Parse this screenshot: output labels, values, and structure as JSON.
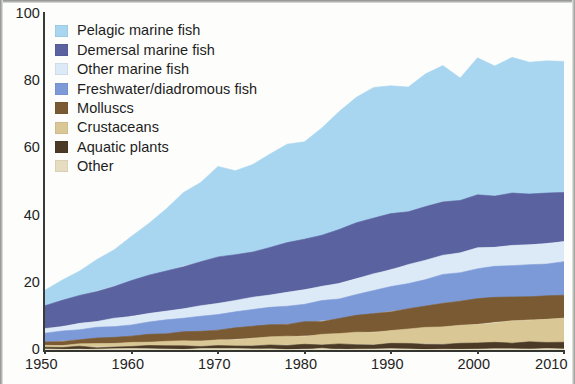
{
  "chart_data": {
    "type": "area",
    "stacked": true,
    "title": "",
    "subtitle": "",
    "xlabel": "",
    "ylabel": "",
    "xlim": [
      1950,
      2010
    ],
    "ylim": [
      0,
      100
    ],
    "xticks": [
      1950,
      1960,
      1970,
      1980,
      1990,
      2000,
      2010
    ],
    "yticks": [
      0,
      20,
      40,
      60,
      80,
      100
    ],
    "grid": false,
    "legend_position": "top-left",
    "x": [
      1950,
      1952,
      1954,
      1956,
      1958,
      1960,
      1962,
      1964,
      1966,
      1968,
      1970,
      1972,
      1974,
      1976,
      1978,
      1980,
      1982,
      1984,
      1986,
      1988,
      1990,
      1992,
      1994,
      1996,
      1998,
      2000,
      2002,
      2004,
      2006,
      2008,
      2010
    ],
    "series": [
      {
        "name": "Pelagic marine fish",
        "color": "#a8d6f0",
        "values": [
          4.6,
          6.2,
          7.4,
          9.2,
          10.8,
          13.4,
          15.6,
          18.4,
          21.6,
          23.8,
          26.8,
          25.4,
          26.0,
          27.8,
          29.6,
          29.0,
          31.8,
          35.2,
          37.4,
          38.6,
          38.0,
          37.2,
          39.4,
          40.2,
          36.6,
          40.6,
          38.6,
          40.4,
          39.2,
          39.6,
          39.0
        ]
      },
      {
        "name": "Demersal marine fish",
        "color": "#5a62a0",
        "values": [
          6.8,
          7.6,
          8.2,
          9.0,
          9.6,
          10.4,
          11.2,
          11.8,
          12.6,
          13.2,
          13.8,
          13.6,
          13.8,
          14.2,
          14.6,
          14.8,
          15.2,
          15.8,
          16.4,
          16.8,
          16.4,
          15.8,
          16.0,
          16.2,
          15.4,
          15.8,
          15.2,
          15.4,
          15.0,
          14.8,
          14.6
        ]
      },
      {
        "name": "Other marine fish",
        "color": "#dce9f6",
        "values": [
          1.4,
          1.6,
          1.8,
          2.0,
          2.2,
          2.4,
          2.6,
          2.8,
          3.0,
          3.2,
          3.4,
          3.4,
          3.6,
          3.8,
          4.0,
          4.2,
          4.4,
          4.6,
          4.8,
          5.0,
          5.2,
          5.4,
          5.6,
          5.8,
          5.8,
          6.0,
          6.0,
          6.0,
          6.0,
          6.0,
          6.0
        ]
      },
      {
        "name": "Freshwater/diadromous fish",
        "color": "#7d9ad8",
        "values": [
          2.6,
          2.8,
          3.0,
          3.2,
          3.4,
          3.6,
          3.8,
          4.0,
          4.2,
          4.4,
          4.6,
          4.8,
          5.0,
          5.2,
          5.4,
          5.6,
          5.8,
          6.0,
          6.4,
          6.8,
          7.2,
          7.6,
          8.0,
          8.4,
          8.6,
          9.0,
          9.2,
          9.4,
          9.6,
          9.8,
          10.0
        ]
      },
      {
        "name": "Molluscs",
        "color": "#7a5a33",
        "values": [
          1.0,
          1.2,
          1.4,
          1.6,
          1.8,
          2.0,
          2.2,
          2.4,
          2.6,
          2.8,
          3.0,
          3.2,
          3.4,
          3.6,
          3.8,
          4.0,
          4.2,
          4.6,
          5.0,
          5.4,
          5.8,
          6.2,
          6.6,
          7.0,
          7.2,
          7.6,
          7.2,
          7.0,
          6.8,
          6.8,
          6.8
        ]
      },
      {
        "name": "Crustaceans",
        "color": "#d9c796",
        "values": [
          0.6,
          0.7,
          0.8,
          0.9,
          1.0,
          1.1,
          1.2,
          1.3,
          1.4,
          1.5,
          1.7,
          1.9,
          2.1,
          2.3,
          2.5,
          2.7,
          2.9,
          3.1,
          3.4,
          3.7,
          4.0,
          4.3,
          4.6,
          5.0,
          5.4,
          5.8,
          6.2,
          6.6,
          6.8,
          7.0,
          7.2
        ]
      },
      {
        "name": "Aquatic plants",
        "color": "#4a3a26",
        "values": [
          0.5,
          0.5,
          0.6,
          0.6,
          0.7,
          0.7,
          0.8,
          0.8,
          0.9,
          0.9,
          1.0,
          1.0,
          1.1,
          1.1,
          1.2,
          1.2,
          1.3,
          1.3,
          1.4,
          1.4,
          1.5,
          1.5,
          1.6,
          1.6,
          1.7,
          1.7,
          1.8,
          1.8,
          1.9,
          1.9,
          2.0
        ]
      },
      {
        "name": "Other",
        "color": "#e6ddc0",
        "values": [
          0.3,
          0.3,
          0.3,
          0.3,
          0.3,
          0.3,
          0.3,
          0.3,
          0.3,
          0.3,
          0.3,
          0.3,
          0.3,
          0.3,
          0.3,
          0.3,
          0.3,
          0.3,
          0.3,
          0.3,
          0.3,
          0.3,
          0.3,
          0.3,
          0.3,
          0.3,
          0.3,
          0.3,
          0.3,
          0.3,
          0.3
        ]
      }
    ]
  },
  "axes": {
    "y_tick_labels": [
      "100",
      "80",
      "60",
      "40",
      "20",
      "0"
    ],
    "x_tick_labels": [
      "1950",
      "1960",
      "1970",
      "1980",
      "1990",
      "2000",
      "2010"
    ]
  },
  "legend": {
    "items": [
      {
        "label": "Pelagic marine fish",
        "color": "#a8d6f0"
      },
      {
        "label": "Demersal marine fish",
        "color": "#5a62a0"
      },
      {
        "label": "Other marine fish",
        "color": "#dce9f6"
      },
      {
        "label": "Freshwater/diadromous fish",
        "color": "#7d9ad8"
      },
      {
        "label": "Molluscs",
        "color": "#7a5a33"
      },
      {
        "label": "Crustaceans",
        "color": "#d9c796"
      },
      {
        "label": "Aquatic plants",
        "color": "#4a3a26"
      },
      {
        "label": "Other",
        "color": "#e6ddc0"
      }
    ]
  }
}
